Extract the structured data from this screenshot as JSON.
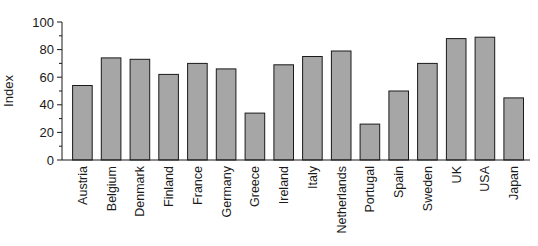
{
  "chart_data": {
    "type": "bar",
    "title": "",
    "xlabel": "",
    "ylabel": "Index",
    "ylim": [
      0,
      100
    ],
    "yticks": [
      0,
      20,
      40,
      60,
      80,
      100
    ],
    "grid": false,
    "legend": null,
    "categories": [
      "Austria",
      "Belgium",
      "Denmark",
      "Finland",
      "France",
      "Germany",
      "Greece",
      "Ireland",
      "Italy",
      "Netherlands",
      "Portugal",
      "Spain",
      "Sweden",
      "UK",
      "USA",
      "Japan"
    ],
    "values": [
      54,
      74,
      73,
      62,
      70,
      66,
      34,
      69,
      75,
      79,
      26,
      50,
      70,
      88,
      89,
      45
    ],
    "bar_color": "#a6a6a6",
    "bar_edge_color": "#1a1a1a"
  }
}
